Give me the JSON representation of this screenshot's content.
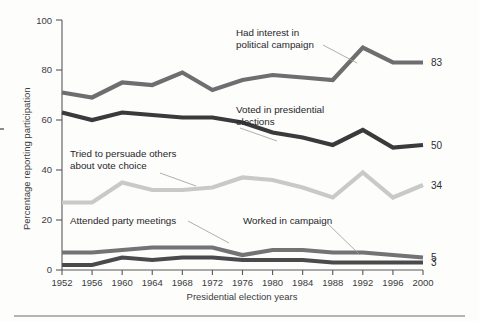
{
  "chart_data": {
    "type": "line",
    "title": "",
    "xlabel": "Presidential election years",
    "ylabel": "Percentage reporting participation",
    "x": [
      1952,
      1956,
      1960,
      1964,
      1968,
      1972,
      1976,
      1980,
      1984,
      1988,
      1992,
      1996,
      2000
    ],
    "categories": [
      "1952",
      "1956",
      "1960",
      "1964",
      "1968",
      "1972",
      "1976",
      "1980",
      "1984",
      "1988",
      "1992",
      "1996",
      "2000"
    ],
    "xlim": [
      1952,
      2000
    ],
    "ylim": [
      0,
      100
    ],
    "yticks": [
      0,
      20,
      40,
      60,
      80,
      100
    ],
    "ytick_labels": [
      "0",
      "20",
      "40",
      "60",
      "80",
      "100"
    ],
    "grid": false,
    "legend": "inline annotations",
    "series": [
      {
        "name": "Had interest in political campaign",
        "color": "#6e6e70",
        "values": [
          71,
          69,
          75,
          74,
          79,
          72,
          76,
          78,
          77,
          76,
          89,
          83,
          83
        ],
        "end_label": "83"
      },
      {
        "name": "Voted in presidential elections",
        "color": "#3a3a3c",
        "values": [
          63,
          60,
          63,
          62,
          61,
          61,
          59,
          55,
          53,
          50,
          56,
          49,
          50
        ],
        "end_label": "50"
      },
      {
        "name": "Tried to persuade others about vote choice",
        "color": "#c9c9c9",
        "values": [
          27,
          27,
          35,
          32,
          32,
          33,
          37,
          36,
          33,
          29,
          39,
          29,
          34
        ],
        "end_label": "34"
      },
      {
        "name": "Attended party meetings",
        "color": "#737375",
        "values": [
          7,
          7,
          8,
          9,
          9,
          9,
          6,
          8,
          8,
          7,
          7,
          6,
          5
        ],
        "end_label": "5"
      },
      {
        "name": "Worked in campaign",
        "color": "#4a4a4c",
        "values": [
          2,
          2,
          5,
          4,
          5,
          5,
          4,
          4,
          4,
          3,
          3,
          3,
          3
        ],
        "end_label": "3"
      }
    ],
    "annotations": [
      {
        "id": "interest",
        "lines": [
          "Had interest in",
          "political campaign"
        ],
        "x": 236,
        "y": 33
      },
      {
        "id": "voted",
        "lines": [
          "Voted in presidential",
          "elections"
        ],
        "x": 236,
        "y": 110
      },
      {
        "id": "persuade",
        "lines": [
          "Tried to persuade others",
          "about vote choice"
        ],
        "x": 70,
        "y": 154
      },
      {
        "id": "meetings",
        "lines": [
          "Attended party meetings"
        ],
        "x": 70,
        "y": 221
      },
      {
        "id": "worked",
        "lines": [
          "Worked in campaign"
        ],
        "x": 243,
        "y": 221
      }
    ]
  },
  "axis": {
    "y_title": "Percentage reporting participation",
    "x_title": "Presidential election years"
  }
}
